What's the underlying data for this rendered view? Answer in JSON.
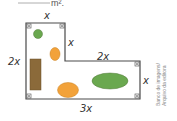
{
  "header": {
    "answer_blank_suffix": "m²."
  },
  "diagram": {
    "type": "L-shaped floor plan",
    "labels": {
      "top_width": "x",
      "inner_vertical": "x",
      "left_height": "2x",
      "inner_horizontal": "2x",
      "right_height": "x",
      "bottom_width": "3x"
    },
    "colors": {
      "outline": "#4a4a4a",
      "green": "#6aa84f",
      "orange": "#f2a23a",
      "brown": "#8b6a3a"
    }
  },
  "credit": {
    "line1": "Banco de imagens/",
    "line2": "Arquivo da editora"
  }
}
